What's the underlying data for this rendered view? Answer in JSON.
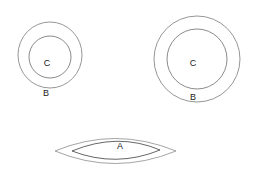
{
  "figure": {
    "background_color": "#ffffff",
    "stroke_color": "#8a8a8a",
    "label_color": "#1a1a1a",
    "width": 257,
    "height": 176
  },
  "shapes": {
    "left_annulus": {
      "name": "Small annulus",
      "outer_label": "B",
      "inner_label": "C",
      "outer_center_x": 50,
      "outer_center_y": 55,
      "outer_radius": 32,
      "inner_center_x": 50,
      "inner_center_y": 57,
      "inner_radius": 21,
      "outer_label_x": 46,
      "outer_label_y": 93,
      "inner_label_x": 47,
      "inner_label_y": 64
    },
    "right_annulus": {
      "name": "Large annulus",
      "outer_label": "B",
      "inner_label": "C",
      "outer_center_x": 197,
      "outer_center_y": 59,
      "outer_radius": 43,
      "inner_center_x": 197,
      "inner_center_y": 59,
      "inner_radius": 30,
      "outer_label_x": 193,
      "outer_label_y": 98,
      "inner_label_x": 193,
      "inner_label_y": 64
    },
    "lens": {
      "name": "Lens / vesica region",
      "inner_label": "A",
      "left_tip_x": 55,
      "right_tip_x": 176,
      "center_y": 151,
      "outer_half_height": 22,
      "inner_left_tip_x": 72,
      "inner_right_tip_x": 160,
      "inner_half_height": 14,
      "inner_label_x": 120,
      "inner_label_y": 146
    }
  },
  "legend": {
    "region_a": "A",
    "region_b": "B",
    "region_c": "C"
  }
}
